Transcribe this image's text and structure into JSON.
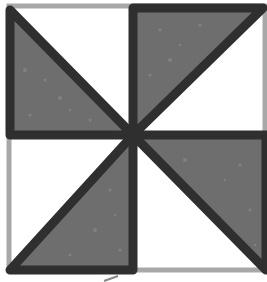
{
  "figure": {
    "colors": {
      "background": "#ffffff",
      "outline_light": "#a8a8a8",
      "outline_dark": "#2f2f2f",
      "shaded_fill": "#6e6e6e"
    },
    "square": {
      "x": 8,
      "y": 5,
      "size": 258
    },
    "center": {
      "x": 133,
      "y": 135
    },
    "triangles": [
      {
        "id": "top-left",
        "points": "10,10 10,135 133,135",
        "shaded": true
      },
      {
        "id": "top-right",
        "points": "133,8 263,8 133,135",
        "shaded": true
      },
      {
        "id": "bottom-left",
        "points": "133,135 133,270 10,270",
        "shaded": true
      },
      {
        "id": "bottom-right",
        "points": "133,135 266,135 266,270",
        "shaded": true
      }
    ]
  }
}
